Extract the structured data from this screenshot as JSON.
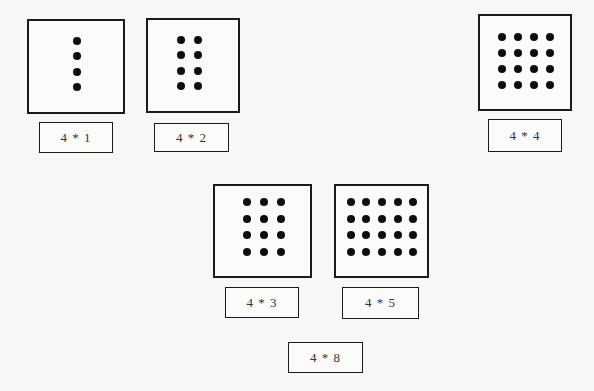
{
  "cards": [
    {
      "id": "4x1",
      "rows": 4,
      "cols": 1,
      "label": "4 * 1"
    },
    {
      "id": "4x2",
      "rows": 4,
      "cols": 2,
      "label": "4 * 2"
    },
    {
      "id": "4x4",
      "rows": 4,
      "cols": 4,
      "label": "4 * 4"
    },
    {
      "id": "4x3",
      "rows": 4,
      "cols": 3,
      "label": "4 * 3"
    },
    {
      "id": "4x5",
      "rows": 4,
      "cols": 5,
      "label": "4 * 5"
    }
  ],
  "extra_label": "4 * 8"
}
